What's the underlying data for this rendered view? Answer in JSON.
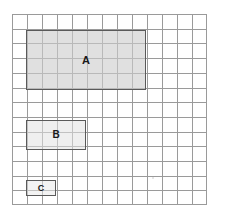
{
  "figure": {
    "title": "",
    "grid": {
      "columns": 13,
      "rows": 13,
      "cell_size_px": 15,
      "line_color": "#9a9a9a",
      "background_color": "#ffffff"
    },
    "rectangles": [
      {
        "label": "A",
        "grid_x": 1,
        "grid_y": 1,
        "width_cells": 8,
        "height_cells": 4,
        "area_cells": 32,
        "perimeter_cells": 24,
        "fill_color": "#cdcdcd",
        "border_color": "#5a5a5a"
      },
      {
        "label": "B",
        "grid_x": 1,
        "grid_y": 7,
        "width_cells": 4,
        "height_cells": 2,
        "area_cells": 8,
        "perimeter_cells": 12,
        "fill_color": "#e1e1e1",
        "border_color": "#5a5a5a"
      },
      {
        "label": "C",
        "grid_x": 1,
        "grid_y": 11,
        "width_cells": 2,
        "height_cells": 1,
        "area_cells": 2,
        "perimeter_cells": 6,
        "fill_color": "#e8e8e8",
        "border_color": "#5a5a5a"
      }
    ]
  }
}
